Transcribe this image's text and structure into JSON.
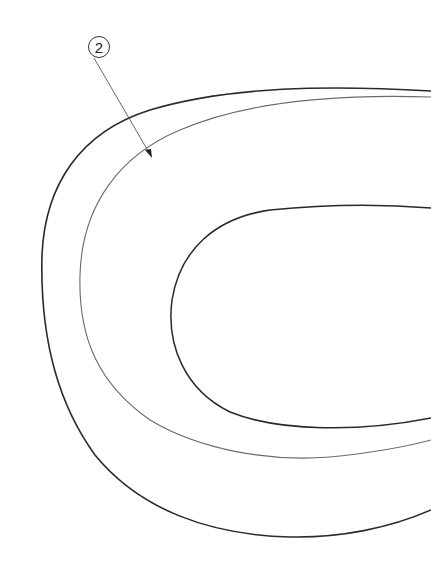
{
  "diagram": {
    "type": "technical-line-drawing",
    "callouts": [
      {
        "label": "2",
        "target": "middle-contour"
      }
    ],
    "colors": {
      "stroke_dark": "#2a2a2a",
      "stroke_light": "#6a6a6a",
      "background": "#ffffff"
    }
  }
}
